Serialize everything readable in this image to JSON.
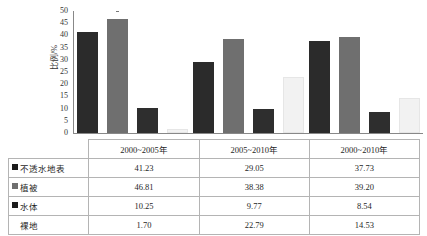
{
  "chart_data": {
    "type": "bar",
    "title": "",
    "subtitle": "",
    "xlabel": "",
    "ylabel": "比例/%",
    "ylim": [
      0,
      50
    ],
    "yticks": [
      0,
      5,
      10,
      15,
      20,
      25,
      30,
      35,
      40,
      45,
      50
    ],
    "grid": false,
    "legend_position": "table-row-labels",
    "categories": [
      "2000~2005年",
      "2005~2010年",
      "2000~2010年"
    ],
    "series": [
      {
        "name": "不透水地表",
        "values": [
          41.23,
          29.05,
          37.73
        ],
        "color": "#2b2b2b"
      },
      {
        "name": "植被",
        "values": [
          46.81,
          38.38,
          39.2
        ],
        "color": "#6f6f6f"
      },
      {
        "name": "水体",
        "values": [
          10.25,
          9.77,
          8.54
        ],
        "color": "#2e2e2e"
      },
      {
        "name": "裸地",
        "values": [
          1.7,
          22.79,
          14.53
        ],
        "color": "#f2f2f2"
      }
    ]
  },
  "table": {
    "header_blank": "",
    "columns": [
      "2000~2005年",
      "2005~2010年",
      "2000~2010年"
    ],
    "rows": [
      {
        "label": "不透水地表",
        "values": [
          "41.23",
          "29.05",
          "37.73"
        ],
        "swatch": "dark"
      },
      {
        "label": "植被",
        "values": [
          "46.81",
          "38.38",
          "39.20"
        ],
        "swatch": "gray"
      },
      {
        "label": "水体",
        "values": [
          "10.25",
          "9.77",
          "8.54"
        ],
        "swatch": "dark"
      },
      {
        "label": "裸地",
        "values": [
          "1.70",
          "22.79",
          "14.53"
        ],
        "swatch": "white"
      }
    ]
  },
  "axis": {
    "y_title": "比例/%",
    "ticks": [
      "50",
      "45",
      "40",
      "35",
      "30",
      "25",
      "20",
      "15",
      "10",
      "5",
      "0"
    ]
  }
}
